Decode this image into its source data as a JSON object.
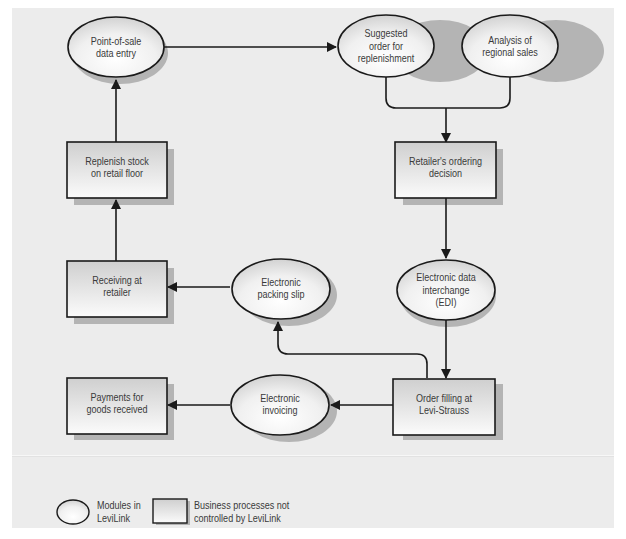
{
  "diagram": {
    "title": "",
    "colors": {
      "panel_background": "#ececec",
      "stroke": "#1a1a1a",
      "shadow": "#b4b4b4",
      "fill_top": "#d4d4d4",
      "fill_bottom": "#fafafa",
      "text": "#3a3a3a"
    },
    "nodes": [
      {
        "id": "pos",
        "type": "ellipse",
        "label_lines": [
          "Point-of-sale",
          "data entry"
        ]
      },
      {
        "id": "suggested",
        "type": "ellipse",
        "label_lines": [
          "Suggested",
          "order for",
          "replenishment"
        ]
      },
      {
        "id": "analysis",
        "type": "ellipse",
        "label_lines": [
          "Analysis of",
          "regional sales"
        ]
      },
      {
        "id": "replenish",
        "type": "rect",
        "label_lines": [
          "Replenish stock",
          "on retail floor"
        ]
      },
      {
        "id": "ordering",
        "type": "rect",
        "label_lines": [
          "Retailer's ordering",
          "decision"
        ]
      },
      {
        "id": "receiving",
        "type": "rect",
        "label_lines": [
          "Receiving at",
          "retailer"
        ]
      },
      {
        "id": "packing",
        "type": "ellipse",
        "label_lines": [
          "Electronic",
          "packing slip"
        ]
      },
      {
        "id": "edi",
        "type": "ellipse",
        "label_lines": [
          "Electronic data",
          "interchange",
          "(EDI)"
        ]
      },
      {
        "id": "payments",
        "type": "rect",
        "label_lines": [
          "Payments for",
          "goods received"
        ]
      },
      {
        "id": "invoicing",
        "type": "ellipse",
        "label_lines": [
          "Electronic",
          "invoicing"
        ]
      },
      {
        "id": "filling",
        "type": "rect",
        "label_lines": [
          "Order filling at",
          "Levi-Strauss"
        ]
      }
    ],
    "edges": [
      {
        "from": "pos",
        "to": "suggested"
      },
      {
        "from": "suggested",
        "to": "ordering"
      },
      {
        "from": "analysis",
        "to": "ordering"
      },
      {
        "from": "ordering",
        "to": "edi"
      },
      {
        "from": "edi",
        "to": "filling"
      },
      {
        "from": "filling",
        "to": "packing"
      },
      {
        "from": "filling",
        "to": "invoicing"
      },
      {
        "from": "packing",
        "to": "receiving"
      },
      {
        "from": "invoicing",
        "to": "payments"
      },
      {
        "from": "receiving",
        "to": "replenish"
      },
      {
        "from": "replenish",
        "to": "pos"
      }
    ]
  },
  "labels": {
    "pos": {
      "l1": "Point-of-sale",
      "l2": "data entry"
    },
    "suggested": {
      "l1": "Suggested",
      "l2": "order for",
      "l3": "replenishment"
    },
    "analysis": {
      "l1": "Analysis of",
      "l2": "regional sales"
    },
    "replenish": {
      "l1": "Replenish stock",
      "l2": "on retail floor"
    },
    "ordering": {
      "l1": "Retailer's ordering",
      "l2": "decision"
    },
    "receiving": {
      "l1": "Receiving at",
      "l2": "retailer"
    },
    "packing": {
      "l1": "Electronic",
      "l2": "packing slip"
    },
    "edi": {
      "l1": "Electronic data",
      "l2": "interchange",
      "l3": "(EDI)"
    },
    "payments": {
      "l1": "Payments for",
      "l2": "goods received"
    },
    "invoicing": {
      "l1": "Electronic",
      "l2": "invoicing"
    },
    "filling": {
      "l1": "Order filling at",
      "l2": "Levi-Strauss"
    }
  },
  "legend": {
    "ellipse": {
      "l1": "Modules in",
      "l2": "LeviLink"
    },
    "rect": {
      "l1": "Business processes not",
      "l2": "controlled by LeviLink"
    }
  }
}
